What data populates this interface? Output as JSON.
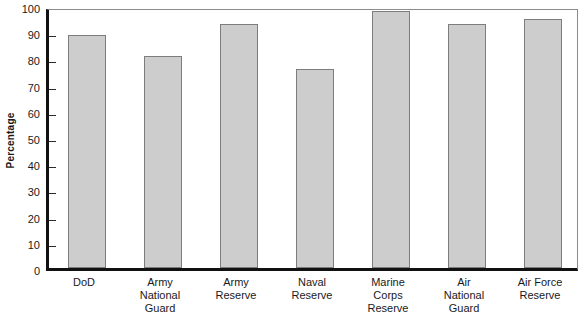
{
  "chart_data": {
    "type": "bar",
    "title": "",
    "xlabel": "",
    "ylabel": "Percentage",
    "ylim": [
      0,
      100
    ],
    "ytick_step": 10,
    "yticks": [
      0,
      10,
      20,
      30,
      40,
      50,
      60,
      70,
      80,
      90,
      100
    ],
    "grid": false,
    "legend": "none",
    "orientation": "vertical",
    "categories": [
      "DoD",
      "Army\nNational\nGuard",
      "Army\nReserve",
      "Naval\nReserve",
      "Marine\nCorps\nReserve",
      "Air\nNational\nGuard",
      "Air Force\nReserve"
    ],
    "values": [
      89,
      81,
      93,
      76,
      98,
      93,
      95
    ],
    "bar_fill_color": "#cdcdcd",
    "bar_border_color": "#7d7d7d",
    "axis_color": "#111111",
    "frame_color": "#8c8c8c",
    "background_color": "#ffffff"
  }
}
